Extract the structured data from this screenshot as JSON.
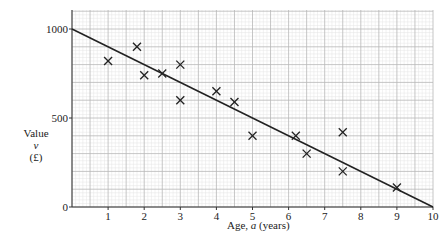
{
  "chart_data": {
    "type": "scatter",
    "title": "",
    "xlabel": "Age, a (years)",
    "ylabel": "Value v (£)",
    "xlim": [
      0,
      10
    ],
    "ylim": [
      0,
      1000
    ],
    "x_ticks": [
      1,
      2,
      3,
      4,
      5,
      6,
      7,
      8,
      9,
      10
    ],
    "y_ticks": [
      0,
      500,
      1000
    ],
    "grid": true,
    "series": [
      {
        "name": "data points",
        "marker": "x",
        "points": [
          {
            "x": 1,
            "y": 820
          },
          {
            "x": 1.8,
            "y": 900
          },
          {
            "x": 2,
            "y": 740
          },
          {
            "x": 2.5,
            "y": 750
          },
          {
            "x": 3,
            "y": 800
          },
          {
            "x": 3,
            "y": 600
          },
          {
            "x": 4,
            "y": 650
          },
          {
            "x": 4.5,
            "y": 590
          },
          {
            "x": 5,
            "y": 400
          },
          {
            "x": 6.2,
            "y": 400
          },
          {
            "x": 6.5,
            "y": 300
          },
          {
            "x": 7.5,
            "y": 420
          },
          {
            "x": 7.5,
            "y": 200
          },
          {
            "x": 9,
            "y": 110
          }
        ]
      },
      {
        "name": "line of best fit",
        "type": "line",
        "points": [
          {
            "x": 0,
            "y": 1000
          },
          {
            "x": 10,
            "y": 0
          }
        ]
      }
    ]
  },
  "labels": {
    "y_value": "Value",
    "y_var": "v",
    "y_unit": "(£)",
    "x_prefix": "Age, ",
    "x_var": "a",
    "x_suffix": " (years)",
    "origin": "0"
  }
}
